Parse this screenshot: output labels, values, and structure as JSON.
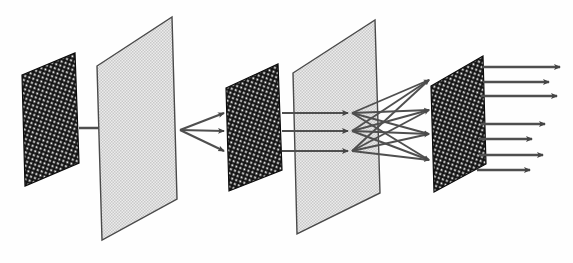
{
  "figure": {
    "type": "diagram",
    "background_color": "#fefefe",
    "width": 573,
    "height": 263
  },
  "style": {
    "dark_fill": "#141414",
    "dark_dot": "#ffffff",
    "light_fill": "#e8e8e8",
    "light_dot": "#bdbdbd",
    "plane_border": "#4a4a4a",
    "arrow_color": "#4f4f4f",
    "arrow_dark": "#3a3a3a"
  },
  "layers": [
    {
      "id": "layer-1",
      "name": "input-plane",
      "shade": "dark",
      "texture": "diagonal-dot",
      "points": "22,75 75,53 79,163 25,186",
      "order": 1
    },
    {
      "id": "layer-2",
      "name": "second-plane",
      "shade": "light",
      "texture": "fine-checker",
      "points": "97,66 172,17 177,199 102,240",
      "order": 2
    },
    {
      "id": "layer-3",
      "name": "third-plane",
      "shade": "dark",
      "texture": "diagonal-dot",
      "points": "226,88 278,64 282,170 229,191",
      "order": 3
    },
    {
      "id": "layer-4",
      "name": "fourth-plane",
      "shade": "light",
      "texture": "fine-checker",
      "points": "293,73 375,20 380,193 297,234",
      "order": 4
    },
    {
      "id": "layer-5",
      "name": "output-plane",
      "shade": "dark",
      "texture": "diagonal-dot",
      "points": "431,86 483,56 486,164 434,192",
      "order": 5
    }
  ],
  "connections": {
    "stage_1": {
      "name": "input-to-second",
      "count": 1,
      "arrows": [
        {
          "x1": 79,
          "y1": 128,
          "x2": 163,
          "y2": 128
        }
      ]
    },
    "stage_2": {
      "name": "second-to-third-fanout",
      "count": 3,
      "origin": {
        "x": 180,
        "y": 130
      },
      "arrows": [
        {
          "x1": 180,
          "y1": 130,
          "x2": 224,
          "y2": 113
        },
        {
          "x1": 180,
          "y1": 130,
          "x2": 224,
          "y2": 131
        },
        {
          "x1": 180,
          "y1": 130,
          "x2": 224,
          "y2": 151
        }
      ]
    },
    "stage_3": {
      "name": "third-to-fourth",
      "count": 3,
      "arrows": [
        {
          "x1": 282,
          "y1": 113,
          "x2": 348,
          "y2": 113
        },
        {
          "x1": 282,
          "y1": 131,
          "x2": 348,
          "y2": 131
        },
        {
          "x1": 282,
          "y1": 151,
          "x2": 348,
          "y2": 151
        }
      ]
    },
    "stage_4": {
      "name": "fourth-to-output-fanout",
      "count": 12,
      "sources": [
        {
          "x": 352,
          "y": 113
        },
        {
          "x": 352,
          "y": 131
        },
        {
          "x": 352,
          "y": 151
        }
      ],
      "targets": [
        {
          "x": 429,
          "y": 80
        },
        {
          "x": 429,
          "y": 110
        },
        {
          "x": 429,
          "y": 134
        },
        {
          "x": 429,
          "y": 160
        }
      ]
    },
    "stage_5": {
      "name": "output-arrows",
      "count": 7,
      "arrows": [
        {
          "x1": 483,
          "y1": 67,
          "x2": 560,
          "y2": 67
        },
        {
          "x1": 483,
          "y1": 82,
          "x2": 549,
          "y2": 82
        },
        {
          "x1": 481,
          "y1": 96,
          "x2": 557,
          "y2": 96
        },
        {
          "x1": 481,
          "y1": 124,
          "x2": 545,
          "y2": 124
        },
        {
          "x1": 479,
          "y1": 139,
          "x2": 532,
          "y2": 139
        },
        {
          "x1": 479,
          "y1": 155,
          "x2": 543,
          "y2": 155
        },
        {
          "x1": 477,
          "y1": 170,
          "x2": 530,
          "y2": 170
        }
      ]
    }
  }
}
